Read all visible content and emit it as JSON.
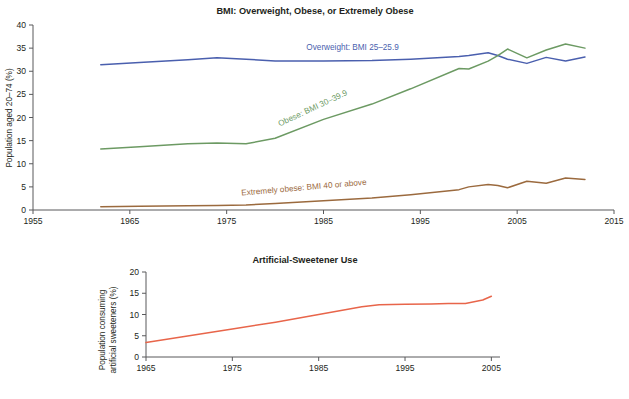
{
  "chart_data": [
    {
      "type": "line",
      "id": "bmi-chart",
      "title": "BMI: Overweight, Obese, or Extremely Obese",
      "xlabel": "",
      "ylabel": "Population aged 20–74 (%)",
      "xlim": [
        1955,
        2015
      ],
      "ylim": [
        0,
        40
      ],
      "xticks": [
        1955,
        1965,
        1975,
        1985,
        1995,
        2005,
        2015
      ],
      "yticks": [
        0,
        5,
        10,
        15,
        20,
        25,
        30,
        35,
        40
      ],
      "grid": false,
      "legend_position": "inline-annotations",
      "series": [
        {
          "name": "Overweight: BMI 25–25.9",
          "color": "#4a5fae",
          "label_x": 1988,
          "label_y": 34.6,
          "label_rotation": 0,
          "x": [
            1962,
            1966,
            1971,
            1974,
            1977,
            1980,
            1985,
            1990,
            1994,
            1999,
            2000,
            2002,
            2003,
            2004,
            2006,
            2008,
            2010,
            2012
          ],
          "y": [
            31.4,
            31.9,
            32.5,
            32.9,
            32.6,
            32.2,
            32.2,
            32.3,
            32.6,
            33.2,
            33.4,
            34.0,
            33.4,
            32.6,
            31.7,
            33.0,
            32.2,
            33.1
          ]
        },
        {
          "name": "Obese: BMI 30–39.9",
          "color": "#6c9a63",
          "label_x": 1984,
          "label_y": 21.5,
          "label_rotation": -25,
          "x": [
            1962,
            1966,
            1971,
            1974,
            1977,
            1980,
            1985,
            1990,
            1994,
            1999,
            2000,
            2002,
            2003,
            2004,
            2006,
            2008,
            2010,
            2012
          ],
          "y": [
            13.2,
            13.7,
            14.3,
            14.5,
            14.3,
            15.5,
            19.6,
            22.9,
            26.2,
            30.6,
            30.5,
            32.2,
            33.4,
            34.8,
            32.9,
            34.6,
            35.9,
            35.0
          ]
        },
        {
          "name": "Extremely obese: BMI 40 or above",
          "color": "#9b6a3e",
          "label_x": 1983,
          "label_y": 4.3,
          "label_rotation": -5,
          "x": [
            1962,
            1966,
            1971,
            1974,
            1977,
            1980,
            1985,
            1990,
            1994,
            1999,
            2000,
            2002,
            2003,
            2004,
            2006,
            2008,
            2010,
            2012
          ],
          "y": [
            0.7,
            0.8,
            0.9,
            1.0,
            1.1,
            1.4,
            2.0,
            2.6,
            3.3,
            4.4,
            5.0,
            5.5,
            5.3,
            4.8,
            6.2,
            5.8,
            6.9,
            6.6
          ]
        }
      ]
    },
    {
      "type": "line",
      "id": "sweetener-chart",
      "title": "Artificial-Sweetener Use",
      "xlabel": "",
      "ylabel": "Population consuming\nartificial sweeteners (%)",
      "ylabel_line1": "Population consuming",
      "ylabel_line2": "artificial sweeteners (%)",
      "xlim": [
        1965,
        2006
      ],
      "ylim": [
        0,
        20
      ],
      "xticks": [
        1965,
        1975,
        1985,
        1995,
        2005
      ],
      "yticks": [
        0,
        5,
        10,
        15,
        20
      ],
      "grid": false,
      "legend_position": "none",
      "series": [
        {
          "name": "Artificial sweetener use",
          "color": "#e8654a",
          "x": [
            1965,
            1970,
            1975,
            1980,
            1985,
            1990,
            1992,
            1995,
            1998,
            2000,
            2002,
            2004,
            2005
          ],
          "y": [
            3.4,
            5.0,
            6.6,
            8.2,
            10.0,
            11.8,
            12.3,
            12.4,
            12.5,
            12.6,
            12.6,
            13.4,
            14.3
          ]
        }
      ]
    }
  ]
}
